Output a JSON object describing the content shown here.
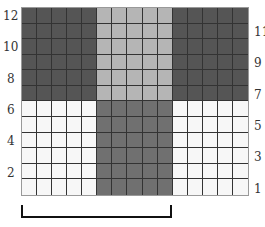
{
  "grid": {
    "rows": 12,
    "cols": 15,
    "colors": {
      "dark": "#555555",
      "light_gray": "#b5b5b5",
      "medium_gray": "#707070",
      "white": "#f7f7f7"
    },
    "blocks": [
      {
        "rows": [
          1,
          6
        ],
        "cols": [
          1,
          5
        ],
        "color": "dark"
      },
      {
        "rows": [
          1,
          6
        ],
        "cols": [
          6,
          10
        ],
        "color": "light_gray"
      },
      {
        "rows": [
          1,
          6
        ],
        "cols": [
          11,
          15
        ],
        "color": "dark"
      },
      {
        "rows": [
          7,
          12
        ],
        "cols": [
          1,
          5
        ],
        "color": "white"
      },
      {
        "rows": [
          7,
          12
        ],
        "cols": [
          6,
          10
        ],
        "color": "medium_gray"
      },
      {
        "rows": [
          7,
          12
        ],
        "cols": [
          11,
          15
        ],
        "color": "white"
      }
    ]
  },
  "left_labels": [
    {
      "text": "12",
      "top": 10
    },
    {
      "text": "10",
      "top": 41
    },
    {
      "text": "8",
      "top": 73
    },
    {
      "text": "6",
      "top": 104
    },
    {
      "text": "4",
      "top": 135
    },
    {
      "text": "2",
      "top": 167
    }
  ],
  "right_labels": [
    {
      "text": "11",
      "top": 26
    },
    {
      "text": "9",
      "top": 57
    },
    {
      "text": "7",
      "top": 89
    },
    {
      "text": "5",
      "top": 120
    },
    {
      "text": "3",
      "top": 151
    },
    {
      "text": "1",
      "top": 183
    }
  ],
  "bracket": {
    "span_cols": 10
  }
}
